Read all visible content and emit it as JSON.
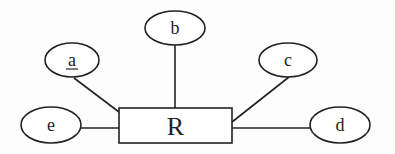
{
  "diagram": {
    "type": "er-diagram",
    "entity": {
      "name": "R",
      "x": 119,
      "y": 108,
      "width": 113,
      "height": 35
    },
    "attributes": [
      {
        "id": "a",
        "label": "a",
        "key": true,
        "cx": 72,
        "cy": 60,
        "rx": 27,
        "ry": 17,
        "line": [
          74,
          78,
          119,
          112
        ]
      },
      {
        "id": "b",
        "label": "b",
        "key": false,
        "cx": 175,
        "cy": 28,
        "rx": 30,
        "ry": 17,
        "line": [
          175,
          45,
          175,
          108
        ]
      },
      {
        "id": "c",
        "label": "c",
        "key": false,
        "cx": 288,
        "cy": 60,
        "rx": 29,
        "ry": 17,
        "line": [
          289,
          77,
          232,
          122
        ]
      },
      {
        "id": "d",
        "label": "d",
        "key": false,
        "cx": 340,
        "cy": 125,
        "rx": 30,
        "ry": 18,
        "line": [
          232,
          128,
          310,
          128
        ]
      },
      {
        "id": "e",
        "label": "e",
        "key": false,
        "cx": 51,
        "cy": 125,
        "rx": 30,
        "ry": 18,
        "line": [
          81,
          128,
          119,
          128
        ]
      }
    ]
  }
}
